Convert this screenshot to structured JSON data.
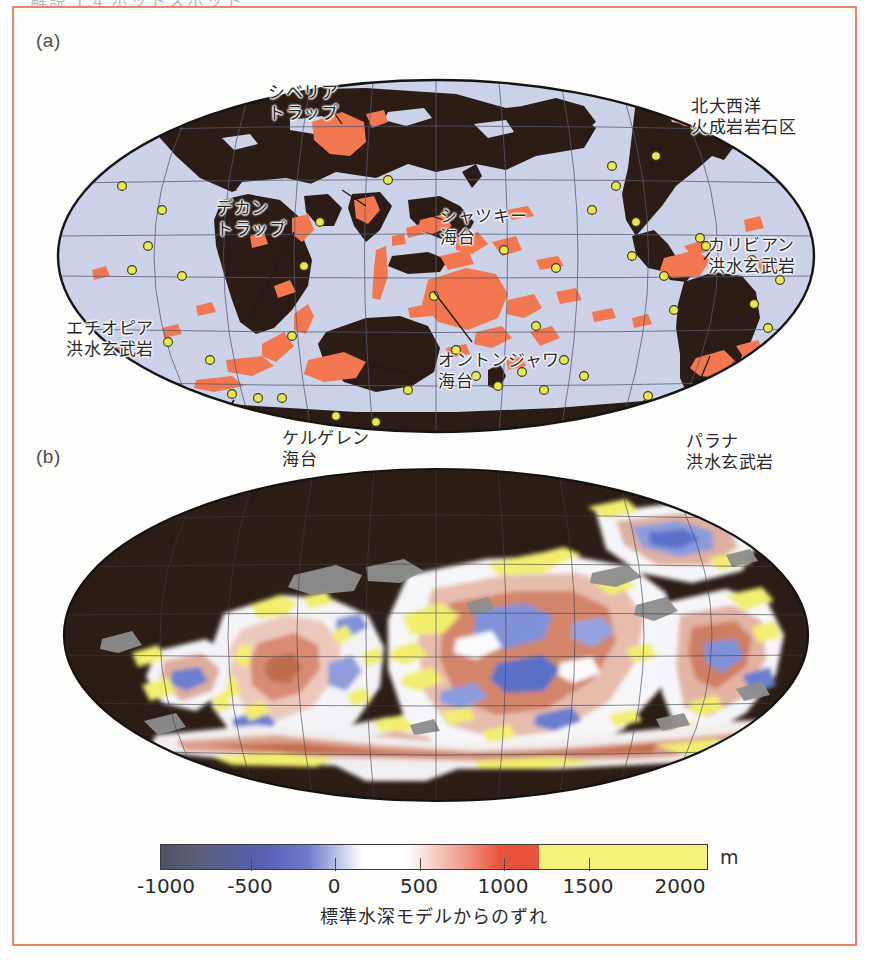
{
  "figure": {
    "top_bleed_text": "解説 1.4 ホットスポット",
    "frame_color": "#e8866a",
    "background": "#fdfdfc"
  },
  "panel_a": {
    "letter": "(a)",
    "projection": "mollweide",
    "ocean_color": "#ccd3e8",
    "land_color": "#2b1d15",
    "lip_color": "#f3774f",
    "hotspot_color": "#e8e84a",
    "graticule_color": "#555a72",
    "labels": [
      {
        "name": "siberian-traps",
        "lines": [
          "シベリア",
          "トラップ"
        ],
        "x": 232,
        "y": 22,
        "align": "left"
      },
      {
        "name": "north-atlantic-lip",
        "lines": [
          "北大西洋",
          "火成岩岩石区"
        ],
        "x": 655,
        "y": 36,
        "align": "left"
      },
      {
        "name": "deccan-traps",
        "lines": [
          "デカン",
          "トラップ"
        ],
        "x": 180,
        "y": 138,
        "align": "left"
      },
      {
        "name": "shatsky-rise",
        "lines": [
          "シャツキー",
          "海台"
        ],
        "x": 404,
        "y": 146,
        "align": "left"
      },
      {
        "name": "caribbean-flood-basalt",
        "lines": [
          "カリビアン",
          "洪水玄武岩"
        ],
        "x": 672,
        "y": 175,
        "align": "left"
      },
      {
        "name": "ethiopian-flood-basalt",
        "lines": [
          "エチオピア",
          "洪水玄武岩"
        ],
        "x": 30,
        "y": 258,
        "align": "left"
      },
      {
        "name": "ontong-java-plateau",
        "lines": [
          "オントンジャワ",
          "海台"
        ],
        "x": 402,
        "y": 290,
        "align": "left"
      },
      {
        "name": "kerguelen-plateau",
        "lines": [
          "ケルゲレン",
          "海台"
        ],
        "x": 246,
        "y": 368,
        "align": "left"
      },
      {
        "name": "parana-flood-basalt",
        "lines": [
          "パラナ",
          "洪水玄武岩"
        ],
        "x": 650,
        "y": 371,
        "align": "left"
      }
    ]
  },
  "panel_b": {
    "letter": "(b)",
    "projection": "mollweide",
    "land_color": "#2b1d15",
    "shelf_color": "#8e8e8e",
    "graticule_color": "#4a4a55"
  },
  "colorbar": {
    "unit": "m",
    "caption": "標準水深モデルからのずれ",
    "ticks": [
      -1000,
      -500,
      0,
      500,
      1000,
      1500,
      2000
    ],
    "tick_labels": [
      "-1000",
      "-500",
      "0",
      "500",
      "1000",
      "1500",
      "2000"
    ],
    "min": -1250,
    "max": 2000,
    "saturation_value": 1000,
    "stops": [
      {
        "pos": 0.0,
        "color": "#4e5263"
      },
      {
        "pos": 0.07,
        "color": "#5a5f7a"
      },
      {
        "pos": 0.19,
        "color": "#5560b4"
      },
      {
        "pos": 0.27,
        "color": "#6e7ccd"
      },
      {
        "pos": 0.37,
        "color": "#ffffff"
      },
      {
        "pos": 0.45,
        "color": "#ffffff"
      },
      {
        "pos": 0.55,
        "color": "#f0a090"
      },
      {
        "pos": 0.62,
        "color": "#e8523a"
      },
      {
        "pos": 0.7,
        "color": "#a5462c"
      },
      {
        "pos": 0.77,
        "color": "#5e3a22"
      },
      {
        "pos": 0.77,
        "color": "#f5f27a"
      },
      {
        "pos": 1.0,
        "color": "#f5f27a"
      }
    ]
  },
  "chart_data": {
    "type": "heatmap",
    "title": "",
    "subtitle": "",
    "xlabel": "",
    "ylabel": "",
    "panels": [
      {
        "id": "a",
        "label": "(a)",
        "description": "Mollweide world map showing large igneous provinces (orange) and hotspots (yellow circles)",
        "annotations": [
          "シベリアトラップ",
          "北大西洋火成岩岩石区",
          "デカントラップ",
          "シャツキー海台",
          "カリビアン洪水玄武岩",
          "エチオピア洪水玄武岩",
          "オントンジャワ海台",
          "ケルゲレン海台",
          "パラナ洪水玄武岩"
        ]
      },
      {
        "id": "b",
        "label": "(b)",
        "description": "Mollweide world map of seafloor depth anomaly relative to standard depth model",
        "colorbar_label": "標準水深モデルからのずれ",
        "colorbar_unit": "m",
        "colorbar_ticks": [
          -1000,
          -500,
          0,
          500,
          1000,
          1500,
          2000
        ]
      }
    ],
    "legend_position": "bottom",
    "grid": true
  }
}
